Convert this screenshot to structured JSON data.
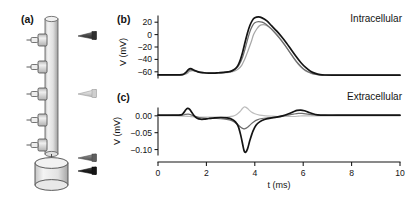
{
  "figure": {
    "panels": [
      {
        "id": "a",
        "label": "(a)"
      },
      {
        "id": "b",
        "label": "(b)"
      },
      {
        "id": "c",
        "label": "(c)"
      }
    ]
  },
  "panel_a": {
    "label": "(a)",
    "description_parts": {
      "axon": "axon-cylinder",
      "soma": "soma-cylinder",
      "electrodes": "electrode-array"
    },
    "electrode_count": 5,
    "markers": [
      {
        "name": "marker-distal-dark",
        "color": "#4a4a4a"
      },
      {
        "name": "marker-mid-light",
        "color": "#d0d0d0"
      },
      {
        "name": "marker-proximal-gray",
        "color": "#7a7a7a"
      },
      {
        "name": "marker-soma-black",
        "color": "#1a1a1a"
      }
    ]
  },
  "chart_data": [
    {
      "type": "line",
      "panel": "b",
      "panel_label": "(b)",
      "title": "Intracellular",
      "xlabel": "",
      "ylabel": "V (mV)",
      "xlim": [
        0,
        10
      ],
      "ylim": [
        -70,
        30
      ],
      "yticks": [
        20,
        0,
        -20,
        -40,
        -60
      ],
      "ytick_labels": [
        "20",
        "0",
        "−20",
        "−40",
        "−60"
      ],
      "xticks": [
        0,
        2,
        4,
        6,
        8,
        10
      ],
      "grid": false,
      "legend": "none",
      "series": [
        {
          "name": "soma-black",
          "color": "#141414",
          "x": [
            0.0,
            0.5,
            0.9,
            1.05,
            1.15,
            1.25,
            1.35,
            1.5,
            1.7,
            1.9,
            2.1,
            2.3,
            2.5,
            2.7,
            2.9,
            3.05,
            3.2,
            3.3,
            3.4,
            3.5,
            3.6,
            3.7,
            3.8,
            3.9,
            4.0,
            4.15,
            4.3,
            4.5,
            4.7,
            4.9,
            5.1,
            5.3,
            5.5,
            5.7,
            5.9,
            6.1,
            6.3,
            6.5,
            6.7,
            6.9,
            7.2,
            7.6,
            8.0,
            8.6,
            9.2,
            10.0
          ],
          "y": [
            -65,
            -65,
            -65,
            -64,
            -61,
            -56.5,
            -55,
            -57.5,
            -60.5,
            -61.5,
            -62,
            -62,
            -61.5,
            -61,
            -60,
            -58.5,
            -55,
            -50,
            -41,
            -28,
            -12,
            3,
            15,
            23,
            27,
            28.5,
            27,
            22,
            14,
            6,
            -3,
            -13,
            -24,
            -35,
            -45,
            -53,
            -59,
            -62.5,
            -64.5,
            -65.2,
            -65.5,
            -65.5,
            -65.5,
            -65.5,
            -65.5,
            -65.5
          ]
        },
        {
          "name": "mid-gray",
          "color": "#6e6e6e",
          "x": [
            0.0,
            0.5,
            0.9,
            1.05,
            1.15,
            1.25,
            1.35,
            1.5,
            1.7,
            1.9,
            2.1,
            2.3,
            2.5,
            2.7,
            2.9,
            3.05,
            3.2,
            3.35,
            3.5,
            3.6,
            3.7,
            3.8,
            3.9,
            4.0,
            4.15,
            4.3,
            4.45,
            4.6,
            4.8,
            5.0,
            5.2,
            5.4,
            5.6,
            5.8,
            6.0,
            6.2,
            6.4,
            6.6,
            6.8,
            7.0,
            7.4,
            7.8,
            8.4,
            9.0,
            10.0
          ],
          "y": [
            -65,
            -65,
            -65,
            -64.5,
            -62.5,
            -58.5,
            -57,
            -58.5,
            -60.8,
            -61.8,
            -62.2,
            -62.2,
            -61.8,
            -61.2,
            -60.3,
            -58.8,
            -55.5,
            -49,
            -36,
            -23,
            -8,
            5,
            14,
            19,
            21,
            20,
            17,
            12,
            4,
            -5,
            -15,
            -26,
            -37,
            -47,
            -55,
            -60,
            -63,
            -64.6,
            -65.2,
            -65.5,
            -65.5,
            -65.5,
            -65.5,
            -65.5,
            -65.5
          ]
        },
        {
          "name": "distal-light-gray",
          "color": "#a8a8a8",
          "x": [
            0.0,
            0.5,
            0.9,
            1.05,
            1.2,
            1.3,
            1.45,
            1.6,
            1.8,
            2.0,
            2.2,
            2.4,
            2.6,
            2.8,
            3.0,
            3.15,
            3.3,
            3.45,
            3.6,
            3.72,
            3.85,
            3.95,
            4.08,
            4.2,
            4.35,
            4.5,
            4.7,
            4.9,
            5.1,
            5.3,
            5.5,
            5.7,
            5.9,
            6.1,
            6.3,
            6.5,
            6.7,
            6.9,
            7.3,
            7.8,
            8.5,
            9.2,
            10.0
          ],
          "y": [
            -65,
            -65,
            -65,
            -64.6,
            -62.8,
            -59.5,
            -58,
            -59.5,
            -61,
            -62,
            -62.4,
            -62.4,
            -62,
            -61.4,
            -60.5,
            -59,
            -56,
            -50,
            -38,
            -26,
            -12,
            0,
            9,
            14.5,
            16,
            14.5,
            9,
            1,
            -9,
            -20,
            -32,
            -43,
            -52,
            -58.5,
            -62,
            -64,
            -65,
            -65.4,
            -65.6,
            -65.6,
            -65.6,
            -65.6,
            -65.6
          ]
        }
      ]
    },
    {
      "type": "line",
      "panel": "c",
      "panel_label": "(c)",
      "title": "Extracellular",
      "xlabel": "t (ms)",
      "ylabel": "V (mV)",
      "xlim": [
        0,
        10
      ],
      "ylim": [
        -0.125,
        0.035
      ],
      "yticks": [
        0.0,
        -0.05,
        -0.1
      ],
      "ytick_labels": [
        "0.00",
        "−0.05",
        "−0.10"
      ],
      "xticks": [
        0,
        2,
        4,
        6,
        8,
        10
      ],
      "xtick_labels": [
        "0",
        "2",
        "4",
        "6",
        "8",
        "10"
      ],
      "grid": false,
      "legend": "none",
      "series": [
        {
          "name": "soma-black",
          "color": "#141414",
          "x": [
            0.0,
            0.6,
            0.95,
            1.05,
            1.15,
            1.22,
            1.3,
            1.4,
            1.5,
            1.62,
            1.75,
            1.9,
            2.1,
            2.35,
            2.6,
            2.85,
            3.05,
            3.2,
            3.32,
            3.42,
            3.5,
            3.56,
            3.62,
            3.7,
            3.8,
            3.92,
            4.05,
            4.2,
            4.4,
            4.65,
            4.9,
            5.15,
            5.4,
            5.6,
            5.75,
            5.9,
            6.05,
            6.2,
            6.4,
            6.6,
            6.9,
            7.3,
            7.8,
            8.4,
            9.2,
            10.0
          ],
          "y": [
            0.002,
            0.002,
            0.003,
            0.008,
            0.018,
            0.022,
            0.02,
            0.01,
            0.0,
            -0.007,
            -0.01,
            -0.01,
            -0.008,
            -0.006,
            -0.005,
            -0.006,
            -0.01,
            -0.018,
            -0.032,
            -0.058,
            -0.085,
            -0.104,
            -0.108,
            -0.098,
            -0.072,
            -0.046,
            -0.028,
            -0.018,
            -0.011,
            -0.007,
            -0.004,
            0.0,
            0.006,
            0.012,
            0.016,
            0.017,
            0.015,
            0.011,
            0.006,
            0.003,
            0.002,
            0.002,
            0.002,
            0.002,
            0.002,
            0.002
          ]
        },
        {
          "name": "mid-gray",
          "color": "#6e6e6e",
          "x": [
            0.0,
            0.6,
            1.0,
            1.12,
            1.25,
            1.4,
            1.55,
            1.7,
            1.9,
            2.1,
            2.4,
            2.7,
            2.95,
            3.15,
            3.3,
            3.42,
            3.52,
            3.6,
            3.7,
            3.82,
            3.95,
            4.1,
            4.3,
            4.55,
            4.85,
            5.1,
            5.35,
            5.6,
            5.8,
            5.95,
            6.1,
            6.3,
            6.55,
            6.9,
            7.4,
            8.0,
            8.8,
            10.0
          ],
          "y": [
            0.001,
            0.001,
            0.002,
            0.004,
            0.005,
            0.002,
            -0.002,
            -0.005,
            -0.007,
            -0.008,
            -0.008,
            -0.009,
            -0.012,
            -0.018,
            -0.026,
            -0.034,
            -0.038,
            -0.038,
            -0.034,
            -0.026,
            -0.018,
            -0.012,
            -0.008,
            -0.006,
            -0.004,
            -0.001,
            0.002,
            0.005,
            0.007,
            0.007,
            0.006,
            0.004,
            0.002,
            0.001,
            0.001,
            0.001,
            0.001,
            0.001
          ]
        },
        {
          "name": "distal-light-gray",
          "color": "#bdbdbd",
          "x": [
            0.0,
            0.7,
            1.1,
            1.3,
            1.5,
            1.75,
            2.0,
            2.3,
            2.6,
            2.9,
            3.1,
            3.25,
            3.38,
            3.48,
            3.56,
            3.64,
            3.74,
            3.86,
            4.0,
            4.2,
            4.45,
            4.75,
            5.05,
            5.35,
            5.6,
            5.8,
            5.95,
            6.1,
            6.3,
            6.6,
            7.0,
            7.6,
            8.4,
            9.4,
            10.0
          ],
          "y": [
            0.0,
            0.0,
            -0.001,
            -0.002,
            -0.003,
            -0.004,
            -0.004,
            -0.004,
            -0.004,
            -0.003,
            -0.001,
            0.004,
            0.012,
            0.021,
            0.026,
            0.025,
            0.019,
            0.011,
            0.006,
            0.002,
            0.0,
            -0.001,
            -0.002,
            -0.002,
            -0.002,
            -0.001,
            0.0,
            0.0,
            0.0,
            0.0,
            0.0,
            0.0,
            0.0,
            0.0,
            0.0
          ]
        }
      ]
    }
  ],
  "annotations": {
    "intracellular": "Intracellular",
    "extracellular": "Extracellular"
  },
  "axis_labels": {
    "v_mv": "V (mV)",
    "t_ms": "t (ms)"
  }
}
